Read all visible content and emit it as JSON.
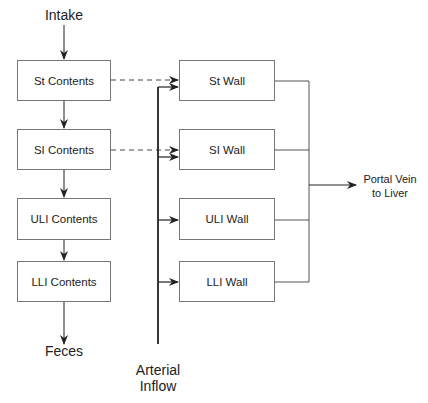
{
  "diagram": {
    "type": "compartment-flow",
    "input_label": "Intake",
    "output_label": "Feces",
    "arterial_label": [
      "Arterial",
      "Inflow"
    ],
    "portal_label": [
      "Portal Vein",
      "to Liver"
    ],
    "contents": [
      {
        "id": "st",
        "label": "St Contents"
      },
      {
        "id": "si",
        "label": "SI Contents"
      },
      {
        "id": "uli",
        "label": "ULI Contents"
      },
      {
        "id": "lli",
        "label": "LLI Contents"
      }
    ],
    "walls": [
      {
        "id": "st",
        "label": "St Wall"
      },
      {
        "id": "si",
        "label": "SI Wall"
      },
      {
        "id": "uli",
        "label": "ULI Wall"
      },
      {
        "id": "lli",
        "label": "LLI Wall"
      }
    ],
    "edges": [
      {
        "from": "Intake",
        "to": "St Contents",
        "style": "solid"
      },
      {
        "from": "St Contents",
        "to": "SI Contents",
        "style": "solid"
      },
      {
        "from": "SI Contents",
        "to": "ULI Contents",
        "style": "solid"
      },
      {
        "from": "ULI Contents",
        "to": "LLI Contents",
        "style": "solid"
      },
      {
        "from": "LLI Contents",
        "to": "Feces",
        "style": "solid"
      },
      {
        "from": "St Contents",
        "to": "St Wall",
        "style": "dashed"
      },
      {
        "from": "SI Contents",
        "to": "SI Wall",
        "style": "dashed"
      },
      {
        "from": "Arterial Inflow",
        "to": "St Wall",
        "style": "solid"
      },
      {
        "from": "Arterial Inflow",
        "to": "SI Wall",
        "style": "solid"
      },
      {
        "from": "Arterial Inflow",
        "to": "ULI Wall",
        "style": "solid"
      },
      {
        "from": "Arterial Inflow",
        "to": "LLI Wall",
        "style": "solid"
      },
      {
        "from": "St Wall",
        "to": "Portal Vein to Liver",
        "style": "solid"
      },
      {
        "from": "SI Wall",
        "to": "Portal Vein to Liver",
        "style": "solid"
      },
      {
        "from": "ULI Wall",
        "to": "Portal Vein to Liver",
        "style": "solid"
      },
      {
        "from": "LLI Wall",
        "to": "Portal Vein to Liver",
        "style": "solid"
      }
    ],
    "colors": {
      "line": "#222222",
      "box_border": "#777777",
      "background": "#ffffff"
    }
  }
}
